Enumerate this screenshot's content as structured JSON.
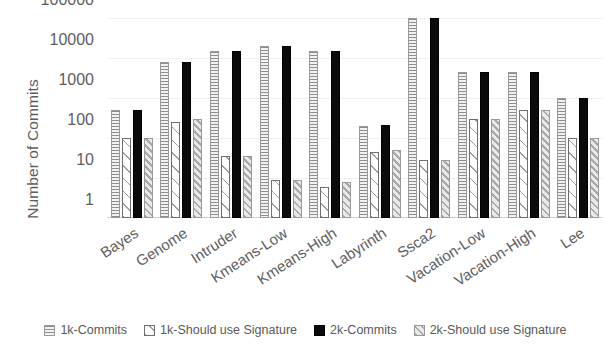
{
  "chart_data": {
    "type": "bar",
    "title": "",
    "xlabel": "",
    "ylabel": "Number of Commits",
    "yscale": "log",
    "ylim": [
      1,
      100000
    ],
    "yticks": [
      1,
      10,
      100,
      1000,
      10000,
      100000
    ],
    "ytick_labels": [
      "1",
      "10",
      "100",
      "1000",
      "10000",
      "100000"
    ],
    "grid": true,
    "legend_position": "bottom",
    "categories": [
      "Bayes",
      "Genome",
      "Intruder",
      "Kmeans-Low",
      "Kmeans-High",
      "Labyrinth",
      "Ssca2",
      "Vacation-Low",
      "Vacation-High",
      "Lee"
    ],
    "series": [
      {
        "name": "1k-Commits",
        "pattern": "horizontal-lines",
        "color": "#f2f2f2",
        "values": [
          500,
          8000,
          15000,
          20000,
          15000,
          200,
          100000,
          4500,
          4500,
          1000
        ]
      },
      {
        "name": "1k-Should use Signature",
        "pattern": "white-diagonal",
        "color": "#ffffff",
        "values": [
          100,
          250,
          35,
          9,
          6,
          45,
          28,
          300,
          500,
          100
        ]
      },
      {
        "name": "2k-Commits",
        "pattern": "solid",
        "color": "#000000",
        "values": [
          500,
          8000,
          15000,
          20000,
          15000,
          210,
          100000,
          4500,
          4500,
          1000
        ]
      },
      {
        "name": "2k-Should use Signature",
        "pattern": "grey-diagonal",
        "color": "#e9e9e9",
        "values": [
          100,
          300,
          35,
          9,
          8,
          50,
          28,
          300,
          500,
          100
        ]
      }
    ]
  }
}
